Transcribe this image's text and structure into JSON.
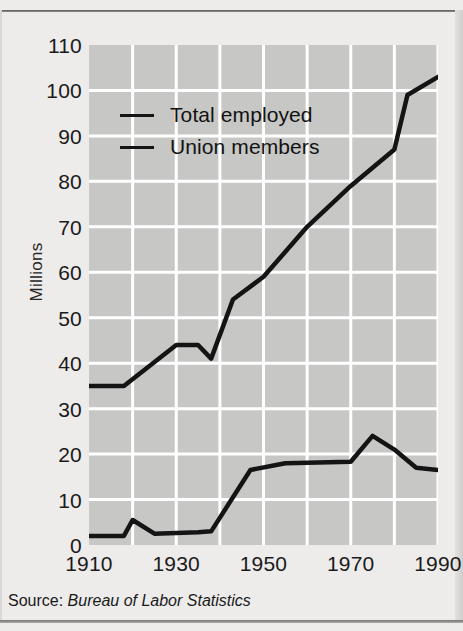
{
  "figure": {
    "source_prefix": "Source:",
    "source_name": "Bureau of Labor Statistics"
  },
  "chart_data": {
    "type": "line",
    "title": "",
    "xlabel": "",
    "ylabel": "Millions",
    "xlim": [
      1910,
      1990
    ],
    "ylim": [
      0,
      110
    ],
    "xticks": [
      1910,
      1930,
      1950,
      1970,
      1990
    ],
    "xticklabels": [
      "1910",
      "1930",
      "1950",
      "1970",
      "1990"
    ],
    "yticks": [
      0,
      10,
      20,
      30,
      40,
      50,
      60,
      70,
      80,
      90,
      100,
      110
    ],
    "yticklabels": [
      "0",
      "10",
      "20",
      "30",
      "40",
      "50",
      "60",
      "70",
      "80",
      "90",
      "100",
      "110"
    ],
    "minor_xgrid_step": 10,
    "grid": true,
    "grid_color": "#ffffff",
    "plot_bg": "#c7c7c5",
    "line_color": "#141414",
    "legend_position": "upper-left-inside",
    "series": [
      {
        "name": "Total employed",
        "x": [
          1910,
          1918,
          1930,
          1935,
          1938,
          1943,
          1950,
          1960,
          1970,
          1980,
          1983,
          1990
        ],
        "values": [
          35,
          35,
          44,
          44,
          41,
          54,
          59,
          70,
          79,
          87,
          99,
          103
        ]
      },
      {
        "name": "Union members",
        "x": [
          1910,
          1918,
          1920,
          1925,
          1935,
          1938,
          1947,
          1955,
          1970,
          1975,
          1980,
          1985,
          1990
        ],
        "values": [
          2,
          2,
          5.5,
          2.5,
          2.8,
          3,
          16.5,
          18,
          18.3,
          24,
          21,
          17,
          16.5
        ]
      }
    ]
  }
}
